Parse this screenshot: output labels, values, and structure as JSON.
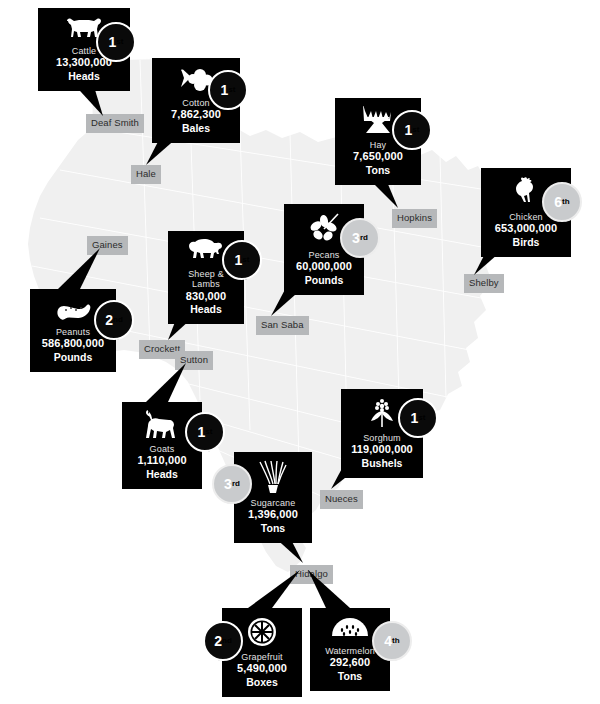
{
  "palette": {
    "card_bg": "#000000",
    "card_text": "#ffffff",
    "map_fill": "#f0f0f0",
    "county_chip": "#b6b8ba",
    "rosette_dark": "#0a0a0a",
    "rosette_light": "#c9cbcd"
  },
  "counties": [
    {
      "name": "Deaf Smith",
      "x": 86,
      "y": 114
    },
    {
      "name": "Hale",
      "x": 131,
      "y": 165
    },
    {
      "name": "Gaines",
      "x": 87,
      "y": 236
    },
    {
      "name": "Crockett",
      "x": 139,
      "y": 340
    },
    {
      "name": "Sutton",
      "x": 175,
      "y": 351
    },
    {
      "name": "San Saba",
      "x": 256,
      "y": 316
    },
    {
      "name": "Hopkins",
      "x": 392,
      "y": 209
    },
    {
      "name": "Shelby",
      "x": 464,
      "y": 274
    },
    {
      "name": "Nueces",
      "x": 320,
      "y": 490
    },
    {
      "name": "Hidalgo",
      "x": 290,
      "y": 565
    }
  ],
  "cards": [
    {
      "id": "cattle",
      "commodity": "Cattle",
      "value": "13,300,000",
      "unit": "Heads",
      "rank": "1",
      "rank_suffix": "st",
      "rank_style": "dark",
      "icon": "cow-icon",
      "county": "Deaf Smith",
      "x": 38,
      "y": 8,
      "w": 92,
      "h": 72,
      "rosette_x": 96,
      "rosette_y": 22,
      "tip_x": 103,
      "tip_y": 116,
      "tail_x1": 70,
      "tail_y1": 80,
      "tail_x2": 92,
      "tail_y2": 80
    },
    {
      "id": "cotton",
      "commodity": "Cotton",
      "value": "7,862,300",
      "unit": "Bales",
      "rank": "1",
      "rank_suffix": "st",
      "rank_style": "dark",
      "icon": "cotton-boll-icon",
      "county": "Hale",
      "x": 152,
      "y": 58,
      "w": 88,
      "h": 72,
      "rosette_x": 208,
      "rosette_y": 70,
      "tip_x": 146,
      "tip_y": 165,
      "tail_x1": 164,
      "tail_y1": 130,
      "tail_x2": 186,
      "tail_y2": 130
    },
    {
      "id": "hay",
      "commodity": "Hay",
      "value": "7,650,000",
      "unit": "Tons",
      "rank": "1",
      "rank_suffix": "st",
      "rank_style": "dark",
      "icon": "hay-sheaf-icon",
      "county": "Hopkins",
      "x": 335,
      "y": 98,
      "w": 86,
      "h": 72,
      "rosette_x": 392,
      "rosette_y": 110,
      "tip_x": 398,
      "tip_y": 208,
      "tail_x1": 360,
      "tail_y1": 170,
      "tail_x2": 382,
      "tail_y2": 170
    },
    {
      "id": "chicken",
      "commodity": "Chicken",
      "value": "653,000,000",
      "unit": "Birds",
      "rank": "6",
      "rank_suffix": "th",
      "rank_style": "light",
      "icon": "chicken-icon",
      "county": "Shelby",
      "x": 481,
      "y": 168,
      "w": 90,
      "h": 72,
      "rosette_x": 542,
      "rosette_y": 182,
      "tip_x": 474,
      "tip_y": 275,
      "tail_x1": 492,
      "tail_y1": 240,
      "tail_x2": 514,
      "tail_y2": 240
    },
    {
      "id": "pecans",
      "commodity": "Pecans",
      "value": "60,000,000",
      "unit": "Pounds",
      "rank": "3",
      "rank_suffix": "rd",
      "rank_style": "light",
      "icon": "pecan-leaf-icon",
      "county": "San Saba",
      "x": 284,
      "y": 204,
      "w": 80,
      "h": 76,
      "rosette_x": 340,
      "rosette_y": 218,
      "tip_x": 271,
      "tip_y": 316,
      "tail_x1": 290,
      "tail_y1": 280,
      "tail_x2": 312,
      "tail_y2": 280
    },
    {
      "id": "sheep-lambs",
      "commodity": "Sheep & Lambs",
      "value": "830,000",
      "unit": "Heads",
      "rank": "1",
      "rank_suffix": "st",
      "rank_style": "dark",
      "icon": "sheep-icon",
      "county": "Crockett",
      "x": 168,
      "y": 231,
      "w": 76,
      "h": 78,
      "rosette_x": 222,
      "rosette_y": 240,
      "tip_x": 168,
      "tip_y": 340,
      "tail_x1": 180,
      "tail_y1": 309,
      "tail_x2": 202,
      "tail_y2": 309
    },
    {
      "id": "peanuts",
      "commodity": "Peanuts",
      "value": "586,800,000",
      "unit": "Pounds",
      "rank": "2",
      "rank_suffix": "nd",
      "rank_style": "dark",
      "icon": "peanut-icon",
      "county": "Gaines",
      "x": 30,
      "y": 289,
      "w": 86,
      "h": 68,
      "rosette_x": 94,
      "rosette_y": 300,
      "tip_x": 100,
      "tip_y": 248,
      "tail_x1": 58,
      "tail_y1": 289,
      "tail_x2": 80,
      "tail_y2": 289
    },
    {
      "id": "goats",
      "commodity": "Goats",
      "value": "1,110,000",
      "unit": "Heads",
      "rank": "1",
      "rank_suffix": "st",
      "rank_style": "dark",
      "icon": "goat-icon",
      "county": "Sutton",
      "x": 122,
      "y": 402,
      "w": 80,
      "h": 72,
      "rosette_x": 185,
      "rosette_y": 412,
      "tip_x": 186,
      "tip_y": 363,
      "tail_x1": 146,
      "tail_y1": 402,
      "tail_x2": 168,
      "tail_y2": 402
    },
    {
      "id": "sorghum",
      "commodity": "Sorghum",
      "value": "119,000,000",
      "unit": "Bushels",
      "rank": "1",
      "rank_suffix": "st",
      "rank_style": "dark",
      "icon": "sorghum-icon",
      "county": "Nueces",
      "x": 341,
      "y": 389,
      "w": 82,
      "h": 70,
      "rosette_x": 398,
      "rosette_y": 398,
      "tip_x": 331,
      "tip_y": 489,
      "tail_x1": 347,
      "tail_y1": 459,
      "tail_x2": 369,
      "tail_y2": 459
    },
    {
      "id": "sugarcane",
      "commodity": "Sugarcane",
      "value": "1,396,000",
      "unit": "Tons",
      "rank": "3",
      "rank_suffix": "rd",
      "rank_style": "light",
      "icon": "sugarcane-icon",
      "county": "Hidalgo",
      "x": 234,
      "y": 452,
      "w": 78,
      "h": 74,
      "rosette_x": 212,
      "rosette_y": 464,
      "tip_x": 303,
      "tip_y": 563,
      "tail_x1": 262,
      "tail_y1": 526,
      "tail_x2": 284,
      "tail_y2": 526
    },
    {
      "id": "grapefruit",
      "commodity": "Grapefruit",
      "value": "5,490,000",
      "unit": "Boxes",
      "rank": "2",
      "rank_suffix": "nd",
      "rank_style": "dark",
      "icon": "grapefruit-icon",
      "county": "Hidalgo",
      "x": 222,
      "y": 608,
      "w": 80,
      "h": 74,
      "rosette_x": 203,
      "rosette_y": 621,
      "tip_x": 300,
      "tip_y": 570,
      "tail_x1": 248,
      "tail_y1": 608,
      "tail_x2": 272,
      "tail_y2": 608
    },
    {
      "id": "watermelon",
      "commodity": "Watermelon",
      "value": "292,600",
      "unit": "Tons",
      "rank": "4",
      "rank_suffix": "th",
      "rank_style": "light",
      "icon": "watermelon-icon",
      "county": "Hidalgo",
      "x": 310,
      "y": 608,
      "w": 80,
      "h": 74,
      "rosette_x": 372,
      "rosette_y": 621,
      "tip_x": 308,
      "tip_y": 570,
      "tail_x1": 326,
      "tail_y1": 608,
      "tail_x2": 350,
      "tail_y2": 608
    }
  ]
}
